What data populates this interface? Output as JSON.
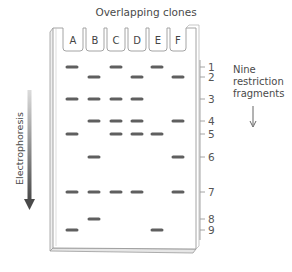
{
  "title": "Overlapping clones",
  "lanes": [
    "A",
    "B",
    "C",
    "D",
    "E",
    "F"
  ],
  "fragments": [
    "1",
    "2",
    "3",
    "4",
    "5",
    "6",
    "7",
    "8",
    "9"
  ],
  "annotation": {
    "line1": "Nine",
    "line2": "restriction",
    "line3": "fragments"
  },
  "axis_label": "Electrophoresis",
  "band_pattern": {
    "A": [
      1,
      3,
      5,
      7,
      9
    ],
    "B": [
      2,
      3,
      4,
      6,
      7,
      8
    ],
    "C": [
      1,
      3,
      4,
      5,
      7
    ],
    "D": [
      2,
      3,
      4,
      5,
      7
    ],
    "E": [
      1,
      5,
      9
    ],
    "F": [
      2,
      4,
      6,
      7
    ]
  },
  "colors": {
    "band": "#5f5f5f",
    "gel_outline": "#9a9a9a",
    "arrow_dark": "#4d4d4d",
    "arrow_light": "#d8d8d8"
  }
}
